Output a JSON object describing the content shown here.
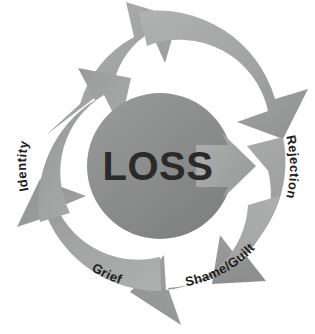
{
  "diagram": {
    "title": "LOSS",
    "type": "cycle-diagram",
    "center": {
      "label": "LOSS",
      "shape": "circle",
      "fill_color": "#8d8f8f"
    },
    "arrow_ring": {
      "fill_color": "#a2a4a4",
      "gap_color": "#ffffff",
      "segment_count": 4,
      "direction": "clockwise"
    },
    "segments": [
      {
        "id": "identity",
        "label": "Identity",
        "position": "left",
        "icon": "curved-arrow-icon"
      },
      {
        "id": "rejection",
        "label": "Rejection",
        "position": "right",
        "icon": "curved-arrow-icon"
      },
      {
        "id": "shame-guilt",
        "label": "Shame/Guilt",
        "position": "bottom-right",
        "icon": "curved-arrow-icon"
      },
      {
        "id": "grief",
        "label": "Grief",
        "position": "bottom-left",
        "icon": "curved-arrow-icon"
      }
    ],
    "center_outflow_arrow": {
      "id": "center-outflow",
      "direction": "right",
      "icon": "arrow-right-icon"
    }
  }
}
